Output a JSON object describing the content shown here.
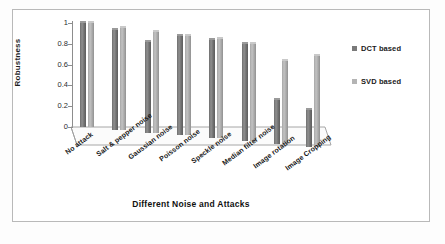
{
  "chart_data": {
    "type": "bar",
    "title": "",
    "xlabel": "Different Noise and Attacks",
    "ylabel": "Robustness",
    "ylim": [
      0,
      1
    ],
    "yticks": [
      "0",
      "0.2",
      "0.4",
      "0.6",
      "0.8",
      "1"
    ],
    "grid": false,
    "legend_position": "right",
    "categories": [
      "No attack",
      "Salt & pepper noise",
      "Gaussian noise",
      "Poisson noise",
      "Speckle noise",
      "Median filter noise",
      "Image rotation",
      "Image Cropping"
    ],
    "series": [
      {
        "name": "DCT based",
        "color": "#7a7a7a",
        "values": [
          1.0,
          0.96,
          0.87,
          0.96,
          0.94,
          0.93,
          0.42,
          0.35
        ]
      },
      {
        "name": "SVD based",
        "color": "#b4b4b4",
        "values": [
          1.0,
          0.98,
          0.97,
          0.96,
          0.95,
          0.93,
          0.8,
          0.87
        ]
      }
    ]
  },
  "legend": {
    "items": [
      {
        "label": "DCT based",
        "color": "#7a7a7a"
      },
      {
        "label": "SVD based",
        "color": "#b4b4b4"
      }
    ]
  }
}
